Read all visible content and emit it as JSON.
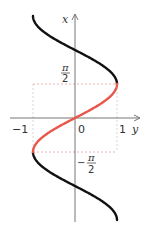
{
  "diagram": {
    "function": "y = sin x",
    "x_range": [
      "-3π/2",
      "3π/2"
    ],
    "highlight_range": [
      "-π/2",
      "π/2"
    ],
    "colors": {
      "curve": "#111111",
      "highlight": "#e8574a",
      "axis": "#666666",
      "guide": "#e8a0a0"
    },
    "labels": {
      "vertical_axis": "x",
      "horizontal_axis": "y",
      "origin": "0",
      "tick_neg_one": "−1",
      "tick_pos_one": "1",
      "pi_half_num": "π",
      "pi_half_den": "2",
      "neg_pi_half_sign": "−",
      "neg_pi_half_num": "π",
      "neg_pi_half_den": "2"
    }
  }
}
